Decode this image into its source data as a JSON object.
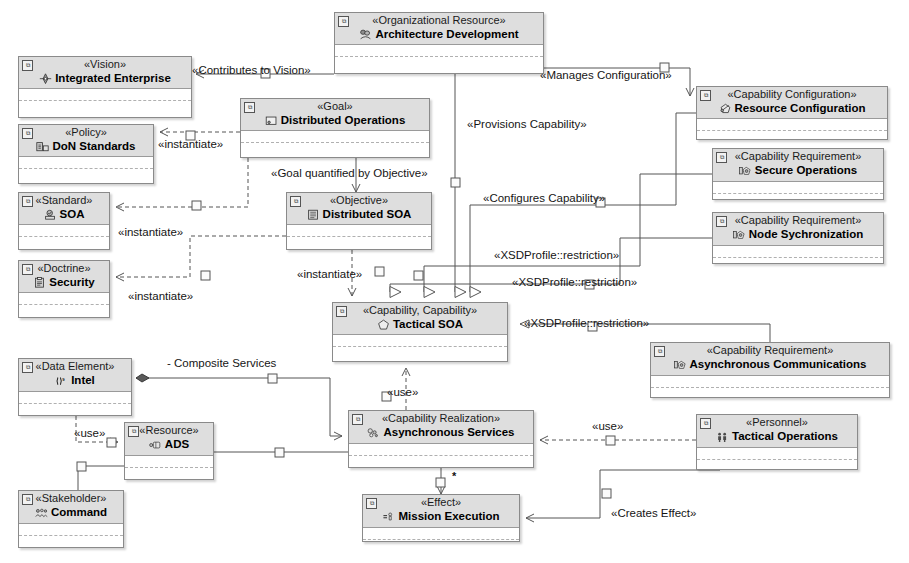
{
  "diagram": {
    "background": "#ffffff",
    "node_header_fill": "#dedede",
    "node_border": "#8a8a8a",
    "line_color": "#555555"
  },
  "nodes": [
    {
      "id": "arch_dev",
      "stereotype": "«Organizational Resource»",
      "name": "Architecture Development",
      "icon": "org-resource-icon",
      "x": 334,
      "y": 12,
      "w": 210,
      "h": 62
    },
    {
      "id": "vision",
      "stereotype": "«Vision»",
      "name": "Integrated Enterprise",
      "icon": "vision-icon",
      "x": 18,
      "y": 56,
      "w": 174,
      "h": 62
    },
    {
      "id": "policy",
      "stereotype": "«Policy»",
      "name": "DoN Standards",
      "icon": "policy-icon",
      "x": 18,
      "y": 124,
      "w": 136,
      "h": 60
    },
    {
      "id": "standard",
      "stereotype": "«Standard»",
      "name": "SOA",
      "icon": "standard-icon",
      "x": 18,
      "y": 192,
      "w": 92,
      "h": 58
    },
    {
      "id": "doctrine",
      "stereotype": "«Doctrine»",
      "name": "Security",
      "icon": "doctrine-icon",
      "x": 18,
      "y": 260,
      "w": 92,
      "h": 58
    },
    {
      "id": "goal",
      "stereotype": "«Goal»",
      "name": "Distributed Operations",
      "icon": "goal-icon",
      "x": 240,
      "y": 98,
      "w": 190,
      "h": 60
    },
    {
      "id": "objective",
      "stereotype": "«Objective»",
      "name": "Distributed SOA",
      "icon": "objective-icon",
      "x": 286,
      "y": 192,
      "w": 146,
      "h": 58
    },
    {
      "id": "tactical",
      "stereotype": "«Capability, Capability»",
      "name": "Tactical SOA",
      "icon": "capability-icon",
      "x": 332,
      "y": 302,
      "w": 176,
      "h": 60
    },
    {
      "id": "res_cfg",
      "stereotype": "«Capability Configuration»",
      "name": "Resource Configuration",
      "icon": "capability-config-icon",
      "x": 696,
      "y": 86,
      "w": 192,
      "h": 54
    },
    {
      "id": "sec_ops",
      "stereotype": "«Capability Requirement»",
      "name": "Secure Operations",
      "icon": "capability-requirement-icon",
      "x": 712,
      "y": 148,
      "w": 172,
      "h": 52
    },
    {
      "id": "node_sync",
      "stereotype": "«Capability Requirement»",
      "name": "Node Sychronization",
      "icon": "capability-requirement-icon",
      "x": 712,
      "y": 212,
      "w": 172,
      "h": 52
    },
    {
      "id": "async_comm",
      "stereotype": "«Capability Requirement»",
      "name": "Asynchronous Communications",
      "icon": "capability-requirement-icon",
      "x": 650,
      "y": 342,
      "w": 240,
      "h": 56
    },
    {
      "id": "intel",
      "stereotype": "«Data Element»",
      "name": "Intel",
      "icon": "data-element-icon",
      "x": 18,
      "y": 358,
      "w": 114,
      "h": 58
    },
    {
      "id": "ads",
      "stereotype": "«Resource»",
      "name": "ADS",
      "icon": "resource-icon",
      "x": 124,
      "y": 422,
      "w": 90,
      "h": 58
    },
    {
      "id": "command",
      "stereotype": "«Stakeholder»",
      "name": "Command",
      "icon": "stakeholder-icon",
      "x": 18,
      "y": 490,
      "w": 106,
      "h": 58
    },
    {
      "id": "async_svc",
      "stereotype": "«Capability Realization»",
      "name": "Asynchronous Services",
      "icon": "capability-realization-icon",
      "x": 348,
      "y": 410,
      "w": 186,
      "h": 58
    },
    {
      "id": "tac_ops",
      "stereotype": "«Personnel»",
      "name": "Tactical Operations",
      "icon": "personnel-icon",
      "x": 696,
      "y": 414,
      "w": 162,
      "h": 56
    },
    {
      "id": "mission",
      "stereotype": "«Effect»",
      "name": "Mission Execution",
      "icon": "effect-icon",
      "x": 362,
      "y": 494,
      "w": 158,
      "h": 48
    }
  ],
  "edge_labels": [
    {
      "id": "l_contributes",
      "text": "«Contributes to Vision»",
      "x": 192,
      "y": 65
    },
    {
      "id": "l_manages",
      "text": "«Manages Configuration»",
      "x": 540,
      "y": 70
    },
    {
      "id": "l_provisions",
      "text": "«Provisions Capability»",
      "x": 467,
      "y": 119
    },
    {
      "id": "l_configures",
      "text": "«Configures Capability»",
      "x": 483,
      "y": 193
    },
    {
      "id": "l_inst1",
      "text": "«instantiate»",
      "x": 158,
      "y": 139
    },
    {
      "id": "l_goalquant",
      "text": "«Goal quantified by Objective»",
      "x": 271,
      "y": 168
    },
    {
      "id": "l_inst2",
      "text": "«instantiate»",
      "x": 118,
      "y": 227
    },
    {
      "id": "l_inst3",
      "text": "«instantiate»",
      "x": 128,
      "y": 291
    },
    {
      "id": "l_inst4",
      "text": "«instantiate»",
      "x": 297,
      "y": 269
    },
    {
      "id": "l_xsd1",
      "text": "«XSDProfile::restriction»",
      "x": 494,
      "y": 250
    },
    {
      "id": "l_xsd2",
      "text": "«XSDProfile::restriction»",
      "x": 512,
      "y": 277
    },
    {
      "id": "l_xsd3",
      "text": "«XSDProfile::restriction»",
      "x": 524,
      "y": 318
    },
    {
      "id": "l_composite",
      "text": "- Composite Services",
      "x": 167,
      "y": 358
    },
    {
      "id": "l_use_tac",
      "text": "«use»",
      "x": 387,
      "y": 387
    },
    {
      "id": "l_use_intel",
      "text": "«use»",
      "x": 74,
      "y": 428
    },
    {
      "id": "l_use_pers",
      "text": "«use»",
      "x": 592,
      "y": 421
    },
    {
      "id": "l_creates",
      "text": "«Creates Effect»",
      "x": 611,
      "y": 508
    }
  ],
  "multiplicities": [
    {
      "id": "m_star",
      "text": "*",
      "x": 452,
      "y": 470
    }
  ]
}
